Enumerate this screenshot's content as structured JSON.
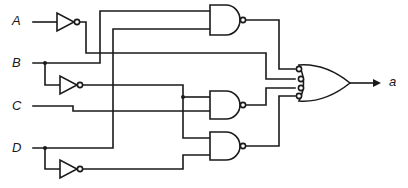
{
  "diagram": {
    "type": "logic-circuit",
    "inputs": [
      {
        "id": "A",
        "label": "A"
      },
      {
        "id": "B",
        "label": "B"
      },
      {
        "id": "C",
        "label": "C"
      },
      {
        "id": "D",
        "label": "D"
      }
    ],
    "output": {
      "id": "a",
      "label": "a"
    },
    "gates": [
      {
        "id": "inv-a",
        "type": "NOT",
        "inputs": [
          "A"
        ]
      },
      {
        "id": "inv-b",
        "type": "NOT",
        "inputs": [
          "B"
        ]
      },
      {
        "id": "inv-d",
        "type": "NOT",
        "inputs": [
          "D"
        ]
      },
      {
        "id": "nand-1",
        "type": "NAND",
        "inputs": [
          "B",
          "D"
        ]
      },
      {
        "id": "nand-2",
        "type": "NAND",
        "inputs": [
          "B'",
          "C"
        ]
      },
      {
        "id": "nand-3",
        "type": "NAND",
        "inputs": [
          "B'",
          "D'"
        ]
      },
      {
        "id": "or-out",
        "type": "OR",
        "inverted_inputs": true,
        "inputs": [
          "nand-1",
          "A'",
          "nand-2",
          "nand-3"
        ]
      }
    ],
    "colors": {
      "line": "#1a1a1a",
      "background": "#ffffff"
    }
  }
}
